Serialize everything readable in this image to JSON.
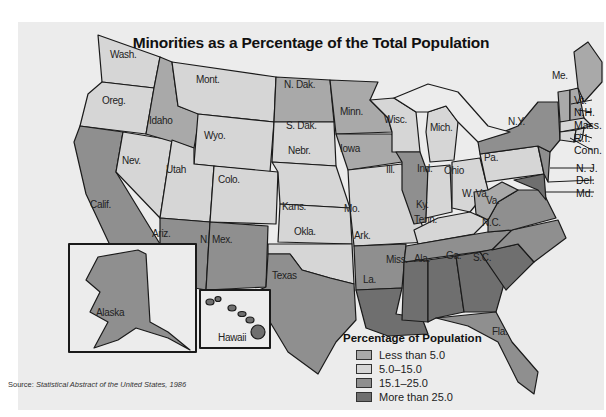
{
  "title": "Minorities as a Percentage of the Total Population",
  "legend": {
    "title": "Percentage of Population",
    "items": [
      {
        "label": "Less than 5.0",
        "color": "#a9a9a9"
      },
      {
        "label": "5.0–15.0",
        "color": "#d6d6d6"
      },
      {
        "label": "15.1–25.0",
        "color": "#8f8f8f"
      },
      {
        "label": "More than 25.0",
        "color": "#6f6f6f"
      }
    ]
  },
  "source": {
    "prefix": "Source:",
    "text": "Statistical Abstract of the United States, 1986"
  },
  "states": [
    {
      "abbr": "Wash.",
      "category": "5.0–15.0"
    },
    {
      "abbr": "Oreg.",
      "category": "5.0–15.0"
    },
    {
      "abbr": "Idaho",
      "category": "Less than 5.0"
    },
    {
      "abbr": "Mont.",
      "category": "5.0–15.0"
    },
    {
      "abbr": "Wyo.",
      "category": "5.0–15.0"
    },
    {
      "abbr": "N. Dak.",
      "category": "Less than 5.0"
    },
    {
      "abbr": "S. Dak.",
      "category": "5.0–15.0"
    },
    {
      "abbr": "Minn.",
      "category": "Less than 5.0"
    },
    {
      "abbr": "Wisc.",
      "category": "5.0–15.0"
    },
    {
      "abbr": "Mich.",
      "category": "5.0–15.0"
    },
    {
      "abbr": "Nev.",
      "category": "5.0–15.0"
    },
    {
      "abbr": "Utah",
      "category": "5.0–15.0"
    },
    {
      "abbr": "Colo.",
      "category": "5.0–15.0"
    },
    {
      "abbr": "Nebr.",
      "category": "5.0–15.0"
    },
    {
      "abbr": "Iowa",
      "category": "Less than 5.0"
    },
    {
      "abbr": "Ill.",
      "category": "15.1–25.0"
    },
    {
      "abbr": "Ind.",
      "category": "5.0–15.0"
    },
    {
      "abbr": "Ohio",
      "category": "5.0–15.0"
    },
    {
      "abbr": "Pa.",
      "category": "5.0–15.0"
    },
    {
      "abbr": "Calif.",
      "category": "15.1–25.0"
    },
    {
      "abbr": "Kans.",
      "category": "5.0–15.0"
    },
    {
      "abbr": "Mo.",
      "category": "5.0–15.0"
    },
    {
      "abbr": "Ky.",
      "category": "5.0–15.0"
    },
    {
      "abbr": "W. Va.",
      "category": "Less than 5.0"
    },
    {
      "abbr": "Va.",
      "category": "15.1–25.0"
    },
    {
      "abbr": "Ariz.",
      "category": "15.1–25.0"
    },
    {
      "abbr": "N. Mex.",
      "category": "15.1–25.0"
    },
    {
      "abbr": "Okla.",
      "category": "5.0–15.0"
    },
    {
      "abbr": "Ark.",
      "category": "15.1–25.0"
    },
    {
      "abbr": "Tenn.",
      "category": "15.1–25.0"
    },
    {
      "abbr": "N.C.",
      "category": "15.1–25.0"
    },
    {
      "abbr": "S.C.",
      "category": "More than 25.0"
    },
    {
      "abbr": "Texas",
      "category": "15.1–25.0"
    },
    {
      "abbr": "La.",
      "category": "More than 25.0"
    },
    {
      "abbr": "Miss.",
      "category": "More than 25.0"
    },
    {
      "abbr": "Ala.",
      "category": "More than 25.0"
    },
    {
      "abbr": "Ga.",
      "category": "More than 25.0"
    },
    {
      "abbr": "Fla.",
      "category": "15.1–25.0"
    },
    {
      "abbr": "N.Y.",
      "category": "15.1–25.0"
    },
    {
      "abbr": "Me.",
      "category": "Less than 5.0"
    },
    {
      "abbr": "Vt.",
      "category": "Less than 5.0"
    },
    {
      "abbr": "N.H.",
      "category": "Less than 5.0"
    },
    {
      "abbr": "Mass.",
      "category": "5.0–15.0"
    },
    {
      "abbr": "R.I.",
      "category": "5.0–15.0"
    },
    {
      "abbr": "Conn.",
      "category": "5.0–15.0"
    },
    {
      "abbr": "N. J.",
      "category": "15.1–25.0"
    },
    {
      "abbr": "Del.",
      "category": "15.1–25.0"
    },
    {
      "abbr": "Md.",
      "category": "More than 25.0"
    },
    {
      "abbr": "Alaska",
      "category": "15.1–25.0"
    },
    {
      "abbr": "Hawaii",
      "category": "More than 25.0"
    }
  ]
}
